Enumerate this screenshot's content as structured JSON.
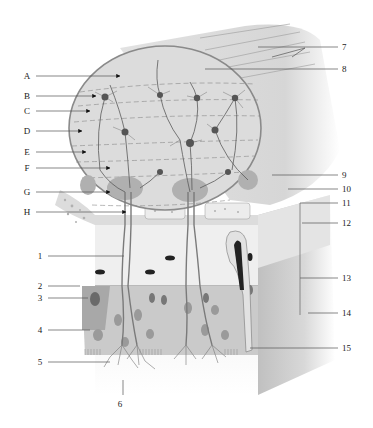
{
  "diagram": {
    "colors": {
      "background": "#ffffff",
      "bulb_fill": "#dedede",
      "bulb_outline": "#8a8a8a",
      "tract_fill": "#e6e6e6",
      "epithelium_fill": "#c4c4c4",
      "lamina_fill": "#ececec",
      "neuron": "#5a5a5a",
      "glomerulus": "#a9a9a9",
      "leader_line": "#555555"
    },
    "left_letter_labels": [
      {
        "id": "A",
        "text": "A",
        "y": 76
      },
      {
        "id": "B",
        "text": "B",
        "y": 96
      },
      {
        "id": "C",
        "text": "C",
        "y": 111
      },
      {
        "id": "D",
        "text": "D",
        "y": 131
      },
      {
        "id": "E",
        "text": "E",
        "y": 152
      },
      {
        "id": "F",
        "text": "F",
        "y": 168
      },
      {
        "id": "G",
        "text": "G",
        "y": 192
      },
      {
        "id": "H",
        "text": "H",
        "y": 212
      }
    ],
    "left_number_labels": [
      {
        "id": "1",
        "text": "1",
        "y": 256
      },
      {
        "id": "2",
        "text": "2",
        "y": 286
      },
      {
        "id": "3",
        "text": "3",
        "y": 298
      },
      {
        "id": "4",
        "text": "4",
        "y": 330
      },
      {
        "id": "5",
        "text": "5",
        "y": 362
      }
    ],
    "bottom_labels": [
      {
        "id": "6",
        "text": "6",
        "x": 120,
        "y": 404
      }
    ],
    "right_labels": [
      {
        "id": "7",
        "text": "7",
        "y": 47
      },
      {
        "id": "8",
        "text": "8",
        "y": 69
      },
      {
        "id": "9",
        "text": "9",
        "y": 175
      },
      {
        "id": "10",
        "text": "10",
        "y": 189
      },
      {
        "id": "11",
        "text": "11",
        "y": 203
      },
      {
        "id": "12",
        "text": "12",
        "y": 223
      },
      {
        "id": "13",
        "text": "13",
        "y": 278
      },
      {
        "id": "14",
        "text": "14",
        "y": 313
      },
      {
        "id": "15",
        "text": "15",
        "y": 348
      }
    ]
  }
}
